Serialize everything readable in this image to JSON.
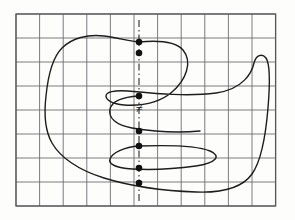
{
  "figure": {
    "title": "",
    "background_color": "#fdfdfc",
    "grid": {
      "name": "square-grid",
      "x0": 16,
      "y0": 14,
      "cell_width": 23.6,
      "cell_height": 24.0,
      "columns": 11,
      "rows": 8,
      "line_color": "#6d6d70",
      "border_color": "#58585b",
      "line_width": 0.9,
      "border_width": 1.3
    },
    "curve": {
      "name": "closed-meander-curve",
      "color": "#1d1d1d",
      "line_width": 1.4,
      "closed": true,
      "description": "self-overlapping closed curve crossing the vertical axis six times"
    },
    "axis_line": {
      "name": "vertical-dash-dot-axis",
      "x": 139,
      "y_top": 20,
      "y_bottom": 203,
      "color": "#2b2b2b",
      "line_width": 1.1,
      "dash_pattern": "7 3 1.5 3"
    },
    "intersection_dots": {
      "name": "curve-axis-intersections",
      "color": "#111111",
      "radius": 3.3,
      "count": 6,
      "points": [
        {
          "label": "p1",
          "x": 139,
          "y": 42
        },
        {
          "label": "p2",
          "x": 139,
          "y": 53
        },
        {
          "label": "p3",
          "x": 139,
          "y": 96
        },
        {
          "label": "p4",
          "x": 139,
          "y": 131
        },
        {
          "label": "p5",
          "x": 139,
          "y": 146
        },
        {
          "label": "p6",
          "x": 139,
          "y": 168
        },
        {
          "label": "p7",
          "x": 139,
          "y": 183
        }
      ]
    },
    "annotation": {
      "name": "not-equal-symbol",
      "symbol": "≠",
      "x": 139,
      "y": 113,
      "color": "#1a1a1a"
    }
  }
}
